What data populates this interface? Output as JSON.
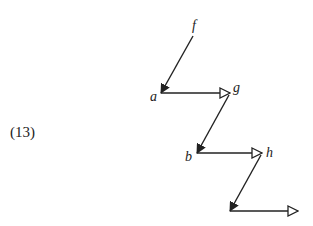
{
  "equation_number": "(13)",
  "colors": {
    "stroke": "#222222",
    "background": "#ffffff"
  },
  "nodes": [
    {
      "id": "f",
      "label": "f",
      "x": 193,
      "y": 34
    },
    {
      "id": "a",
      "label": "a",
      "x": 161,
      "y": 93
    },
    {
      "id": "g",
      "label": "g",
      "x": 230,
      "y": 93
    },
    {
      "id": "b",
      "label": "b",
      "x": 197,
      "y": 153
    },
    {
      "id": "h",
      "label": "h",
      "x": 262,
      "y": 153
    },
    {
      "id": "c",
      "label": "",
      "x": 230,
      "y": 211
    },
    {
      "id": "d",
      "label": "",
      "x": 298,
      "y": 211
    }
  ],
  "edges": [
    {
      "from": "f",
      "to": "a",
      "head": "filled"
    },
    {
      "from": "a",
      "to": "g",
      "head": "hollow"
    },
    {
      "from": "g",
      "to": "b",
      "head": "filled"
    },
    {
      "from": "b",
      "to": "h",
      "head": "hollow"
    },
    {
      "from": "h",
      "to": "c",
      "head": "filled"
    },
    {
      "from": "c",
      "to": "d",
      "head": "hollow"
    }
  ],
  "labels": {
    "f": "f",
    "a": "a",
    "g": "g",
    "b": "b",
    "h": "h"
  }
}
